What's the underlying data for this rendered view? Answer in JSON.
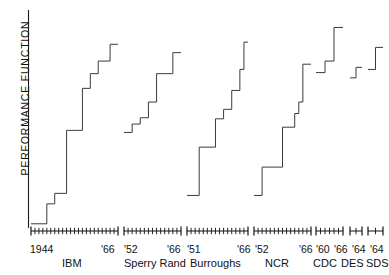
{
  "figure": {
    "ylabel": "PERFORMANCE  FUNCTION",
    "type": "step"
  },
  "chart_data": {
    "type": "line",
    "subtype": "step",
    "title": "",
    "xlabel": "",
    "ylabel": "PERFORMANCE FUNCTION",
    "grid": false,
    "legend": "none",
    "ylim": [
      0,
      1
    ],
    "note": "Step curves of computer performance function vs. year of introduction, one segmented axis per manufacturer.",
    "series": [
      {
        "name": "IBM",
        "x_start_label": "1944",
        "x_end_label": "'66",
        "steps": [
          {
            "x": 1944,
            "y": 0.02
          },
          {
            "x": 1948,
            "y": 0.02
          },
          {
            "x": 1948,
            "y": 0.115
          },
          {
            "x": 1950,
            "y": 0.115
          },
          {
            "x": 1950,
            "y": 0.165
          },
          {
            "x": 1953,
            "y": 0.165
          },
          {
            "x": 1953,
            "y": 0.465
          },
          {
            "x": 1957,
            "y": 0.465
          },
          {
            "x": 1957,
            "y": 0.665
          },
          {
            "x": 1959,
            "y": 0.665
          },
          {
            "x": 1959,
            "y": 0.735
          },
          {
            "x": 1961,
            "y": 0.735
          },
          {
            "x": 1961,
            "y": 0.795
          },
          {
            "x": 1964,
            "y": 0.795
          },
          {
            "x": 1964,
            "y": 0.875
          },
          {
            "x": 1966,
            "y": 0.875
          }
        ]
      },
      {
        "name": "Sperry Rand",
        "x_start_label": "'52",
        "x_end_label": "'66",
        "steps": [
          {
            "x": 1952,
            "y": 0.455
          },
          {
            "x": 1954,
            "y": 0.455
          },
          {
            "x": 1954,
            "y": 0.495
          },
          {
            "x": 1956,
            "y": 0.495
          },
          {
            "x": 1956,
            "y": 0.525
          },
          {
            "x": 1958,
            "y": 0.525
          },
          {
            "x": 1958,
            "y": 0.6
          },
          {
            "x": 1960,
            "y": 0.6
          },
          {
            "x": 1960,
            "y": 0.735
          },
          {
            "x": 1964,
            "y": 0.735
          },
          {
            "x": 1964,
            "y": 0.835
          },
          {
            "x": 1966,
            "y": 0.835
          }
        ]
      },
      {
        "name": "Burroughs",
        "x_start_label": "'51",
        "x_end_label": "'66",
        "steps": [
          {
            "x": 1951,
            "y": 0.155
          },
          {
            "x": 1954,
            "y": 0.155
          },
          {
            "x": 1954,
            "y": 0.385
          },
          {
            "x": 1958,
            "y": 0.385
          },
          {
            "x": 1958,
            "y": 0.52
          },
          {
            "x": 1960,
            "y": 0.52
          },
          {
            "x": 1960,
            "y": 0.565
          },
          {
            "x": 1962,
            "y": 0.565
          },
          {
            "x": 1962,
            "y": 0.655
          },
          {
            "x": 1964,
            "y": 0.655
          },
          {
            "x": 1964,
            "y": 0.755
          },
          {
            "x": 1965,
            "y": 0.755
          },
          {
            "x": 1965,
            "y": 0.885
          },
          {
            "x": 1966,
            "y": 0.885
          }
        ]
      },
      {
        "name": "NCR",
        "x_start_label": "'52",
        "x_end_label": "'66",
        "steps": [
          {
            "x": 1952,
            "y": 0.155
          },
          {
            "x": 1954,
            "y": 0.155
          },
          {
            "x": 1954,
            "y": 0.29
          },
          {
            "x": 1959,
            "y": 0.29
          },
          {
            "x": 1959,
            "y": 0.48
          },
          {
            "x": 1962,
            "y": 0.48
          },
          {
            "x": 1962,
            "y": 0.545
          },
          {
            "x": 1963,
            "y": 0.545
          },
          {
            "x": 1963,
            "y": 0.6
          },
          {
            "x": 1964,
            "y": 0.6
          },
          {
            "x": 1964,
            "y": 0.78
          },
          {
            "x": 1966,
            "y": 0.78
          }
        ]
      },
      {
        "name": "CDC",
        "x_start_label": "'60",
        "x_end_label": "'66",
        "steps": [
          {
            "x": 1960,
            "y": 0.74
          },
          {
            "x": 1962,
            "y": 0.74
          },
          {
            "x": 1962,
            "y": 0.795
          },
          {
            "x": 1964,
            "y": 0.795
          },
          {
            "x": 1964,
            "y": 0.955
          },
          {
            "x": 1966,
            "y": 0.955
          }
        ]
      },
      {
        "name": "DES",
        "x_start_label": "'64",
        "x_end_label": "'64",
        "steps": [
          {
            "x": 1963,
            "y": 0.715
          },
          {
            "x": 1964,
            "y": 0.715
          },
          {
            "x": 1964,
            "y": 0.765
          },
          {
            "x": 1965,
            "y": 0.765
          }
        ]
      },
      {
        "name": "SDS",
        "x_start_label": "'64",
        "x_end_label": "'64",
        "steps": [
          {
            "x": 1963,
            "y": 0.755
          },
          {
            "x": 1964,
            "y": 0.755
          },
          {
            "x": 1964,
            "y": 0.86
          },
          {
            "x": 1965,
            "y": 0.86
          }
        ]
      }
    ]
  },
  "axis_groups": [
    {
      "key": "ibm",
      "name": "IBM",
      "start_label": "1944",
      "end_label": "'66",
      "ticks": 23
    },
    {
      "key": "sperry",
      "name": "Sperry Rand",
      "start_label": "'52",
      "end_label": "'66",
      "ticks": 15
    },
    {
      "key": "burroughs",
      "name": "Burroughs",
      "start_label": "'51",
      "end_label": "'66",
      "ticks": 16
    },
    {
      "key": "ncr",
      "name": "NCR",
      "start_label": "'52",
      "end_label": "'66",
      "ticks": 15
    },
    {
      "key": "cdc",
      "name": "CDC",
      "start_label": "'60",
      "end_label": "'66",
      "ticks": 7
    },
    {
      "key": "des",
      "name": "DES",
      "start_label": "'64",
      "end_label": "",
      "ticks": 3
    },
    {
      "key": "sds",
      "name": "SDS",
      "start_label": "'64",
      "end_label": "",
      "ticks": 3
    }
  ],
  "colors": {
    "line": "#3a3a3a",
    "axis": "#111111",
    "background": "#ffffff",
    "text": "#111111"
  }
}
